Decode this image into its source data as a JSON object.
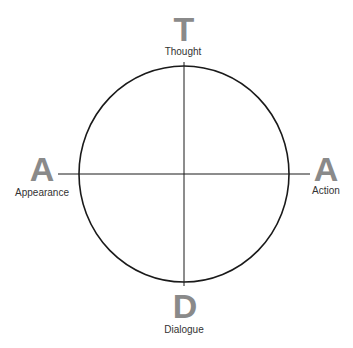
{
  "diagram": {
    "type": "compass-circle",
    "stroke_color": "#1a1a1a",
    "letter_color": "#8a8a8a",
    "label_color": "#333333",
    "top": {
      "letter": "T",
      "label": "Thought"
    },
    "left": {
      "letter": "A",
      "label": "Appearance"
    },
    "right": {
      "letter": "A",
      "label": "Action"
    },
    "bottom": {
      "letter": "D",
      "label": "Dialogue"
    }
  }
}
